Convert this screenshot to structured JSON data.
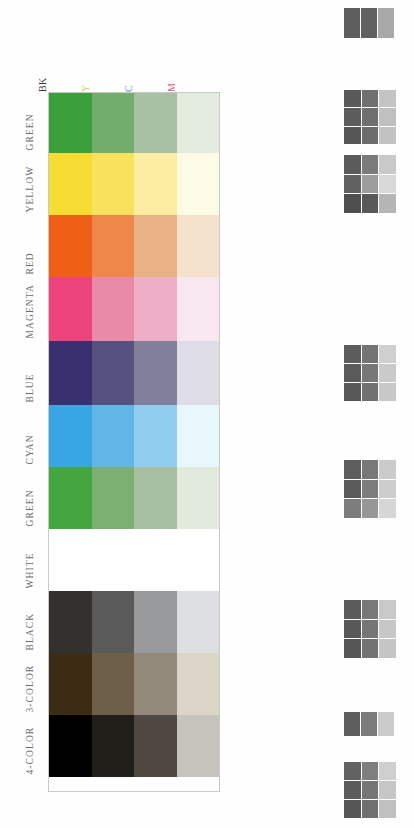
{
  "document": {
    "title": "Printer Color Test Chart",
    "background_color": "#fefefe"
  },
  "chart_data": {
    "type": "heatmap",
    "xlabel": "",
    "ylabel": "",
    "grid": true,
    "legend_position": "none",
    "column_headers": [
      {
        "label": "BK",
        "name": "black",
        "color": "#3a3a3a"
      },
      {
        "label": "Y",
        "name": "yellow",
        "color": "#e8c53a"
      },
      {
        "label": "C",
        "name": "cyan",
        "color": "#3ba3dd"
      },
      {
        "label": "M",
        "name": "magenta",
        "color": "#e2607a"
      }
    ],
    "categories": [
      "GREEN",
      "YELLOW",
      "RED",
      "MAGENTA",
      "BLUE",
      "CYAN",
      "GREEN",
      "WHITE",
      "BLACK",
      "3-COLOR",
      "4-COLOR"
    ],
    "rows": [
      {
        "label": "GREEN",
        "height": 60,
        "values": [
          "#3ba03c",
          "#72ad6b",
          "#a8c1a5",
          "#e3ecdf"
        ]
      },
      {
        "label": "YELLOW",
        "height": 62,
        "values": [
          "#f7dc33",
          "#f8e25d",
          "#fbeda1",
          "#fdfae6"
        ]
      },
      {
        "label": "RED",
        "height": 62,
        "values": [
          "#ef5f15",
          "#f0874a",
          "#e8b284",
          "#f4e2cf"
        ]
      },
      {
        "label": "MAGENTA",
        "height": 64,
        "values": [
          "#ed447e",
          "#e98ba6",
          "#eeaec6",
          "#f8e7ee"
        ]
      },
      {
        "label": "BLUE",
        "height": 64,
        "values": [
          "#3a3070",
          "#56527f",
          "#807f9c",
          "#dedce6"
        ]
      },
      {
        "label": "CYAN",
        "height": 62,
        "values": [
          "#37a6e3",
          "#61b6e8",
          "#90cdee",
          "#e7f7fb"
        ]
      },
      {
        "label": "GREEN",
        "height": 62,
        "values": [
          "#43a63f",
          "#7bb072",
          "#a6bfa0",
          "#e2eadd"
        ]
      },
      {
        "label": "WHITE",
        "height": 62,
        "values": [
          "#ffffff",
          "#ffffff",
          "#ffffff",
          "#ffffff"
        ]
      },
      {
        "label": "BLACK",
        "height": 62,
        "values": [
          "#34302e",
          "#595a59",
          "#97999b",
          "#dedfe1"
        ]
      },
      {
        "label": "3-COLOR",
        "height": 62,
        "values": [
          "#3d2c14",
          "#6d5f48",
          "#93897a",
          "#dcd6c9"
        ]
      },
      {
        "label": "4-COLOR",
        "height": 62,
        "values": [
          "#000000",
          "#211d19",
          "#4e4840",
          "#c6c3bb"
        ]
      }
    ]
  },
  "test_patches": [
    {
      "name": "patch-group-1",
      "top": 8,
      "left": 6,
      "width": 50,
      "height": 30,
      "cols": 3,
      "rows": 1,
      "values": [
        "#5e5e5e",
        "#606060",
        "#a9a9a9"
      ]
    },
    {
      "name": "patch-group-2",
      "top": 90,
      "left": 6,
      "width": 52,
      "height": 54,
      "cols": 3,
      "rows": 3,
      "values": [
        "#595959",
        "#707070",
        "#c4c4c4",
        "#5c5c5c",
        "#6f6f6f",
        "#c0c0c0",
        "#565656",
        "#6d6d6d",
        "#c2c2c2"
      ]
    },
    {
      "name": "patch-group-3",
      "top": 155,
      "left": 6,
      "width": 52,
      "height": 58,
      "cols": 3,
      "rows": 3,
      "values": [
        "#5a5a5a",
        "#7b7b7b",
        "#c9c9c9",
        "#606060",
        "#9c9c9c",
        "#d8d8d8",
        "#4f4f4f",
        "#585858",
        "#b5b5b5"
      ]
    },
    {
      "name": "patch-group-4",
      "top": 345,
      "left": 6,
      "width": 52,
      "height": 56,
      "cols": 3,
      "rows": 3,
      "values": [
        "#5c5c5c",
        "#747474",
        "#cfcfcf",
        "#5a5a5a",
        "#777777",
        "#cacaca",
        "#585858",
        "#717171",
        "#c8c8c8"
      ]
    },
    {
      "name": "patch-group-5",
      "top": 460,
      "left": 6,
      "width": 52,
      "height": 58,
      "cols": 3,
      "rows": 3,
      "values": [
        "#5d5d5d",
        "#787878",
        "#cbcbcb",
        "#5a5a5a",
        "#7d7d7d",
        "#cdcdcd",
        "#7d7d7d",
        "#979797",
        "#d6d6d6"
      ]
    },
    {
      "name": "patch-group-6",
      "top": 600,
      "left": 6,
      "width": 52,
      "height": 58,
      "cols": 3,
      "rows": 3,
      "values": [
        "#5b5b5b",
        "#787878",
        "#c9c9c9",
        "#585858",
        "#757575",
        "#c7c7c7",
        "#565656",
        "#737373",
        "#c5c5c5"
      ]
    },
    {
      "name": "patch-group-7",
      "top": 712,
      "left": 6,
      "width": 50,
      "height": 24,
      "cols": 3,
      "rows": 1,
      "values": [
        "#5e5e5e",
        "#7b7b7b",
        "#cbcbcb"
      ]
    },
    {
      "name": "patch-group-8",
      "top": 762,
      "left": 6,
      "width": 52,
      "height": 56,
      "cols": 3,
      "rows": 3,
      "values": [
        "#626262",
        "#7e7e7e",
        "#cfcfcf",
        "#5b5b5b",
        "#767676",
        "#c6c6c6",
        "#565656",
        "#6f6f6f",
        "#c0c0c0"
      ]
    }
  ]
}
